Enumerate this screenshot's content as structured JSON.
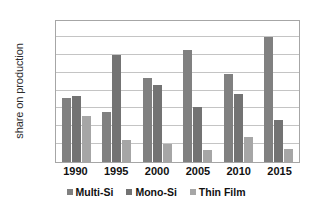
{
  "chart_data": {
    "type": "bar",
    "title": "",
    "xlabel": "",
    "ylabel": "share on production",
    "categories": [
      "1990",
      "1995",
      "2000",
      "2005",
      "2010",
      "2015"
    ],
    "series": [
      {
        "name": "Multi-Si",
        "color": "#808080",
        "values": [
          36,
          28,
          47,
          62.5,
          49,
          70
        ]
      },
      {
        "name": "Mono-Si",
        "color": "#737373",
        "values": [
          37,
          60,
          43,
          31,
          38,
          23.5
        ]
      },
      {
        "name": "Thin Film",
        "color": "#a6a6a6",
        "values": [
          26,
          12.5,
          10,
          6.5,
          14,
          7.5
        ]
      }
    ],
    "ylim": [
      0,
      80
    ],
    "ytick_labels": [
      "0%",
      "10%",
      "20%",
      "30%",
      "40%",
      "50%",
      "60%",
      "70%",
      "80%"
    ],
    "ytick_values": [
      0,
      10,
      20,
      30,
      40,
      50,
      60,
      70,
      80
    ],
    "grid": true,
    "legend_position": "bottom"
  }
}
